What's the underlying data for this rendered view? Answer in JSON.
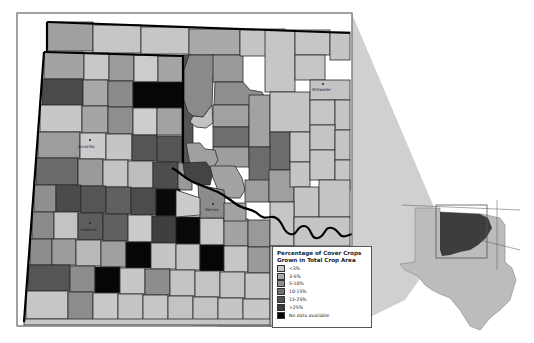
{
  "legend": {
    "title_line1": "Percentage of Cover Crops",
    "title_line2": "Grown in Total Crop Area",
    "items": [
      {
        "label": "<3%",
        "color": "#c8c8c8"
      },
      {
        "label": "3-5%",
        "color": "#a9a9a9"
      },
      {
        "label": "5-10%",
        "color": "#8e8e8e"
      },
      {
        "label": "10-15%",
        "color": "#707070"
      },
      {
        "label": "15-25%",
        "color": "#555555"
      },
      {
        "label": ">25%",
        "color": "#3a3a3a"
      },
      {
        "label": "No data available",
        "color": "#050505"
      }
    ]
  },
  "cities": [
    {
      "name": "Amarillo",
      "x": 90,
      "y": 142
    },
    {
      "name": "Lubbock",
      "x": 88,
      "y": 226
    },
    {
      "name": "Vernon",
      "x": 212,
      "y": 205
    },
    {
      "name": "Stillwater",
      "x": 318,
      "y": 87
    }
  ],
  "inset": {
    "description": "Texas and Oklahoma locator map with study region highlighted"
  },
  "colors": {
    "county_border": "#2a2a2a",
    "state_border": "#000000",
    "inset_highlight": "#3d3d3d",
    "inset_base": "#bcbcbc",
    "projection_wedge": "#cfcfcf"
  }
}
